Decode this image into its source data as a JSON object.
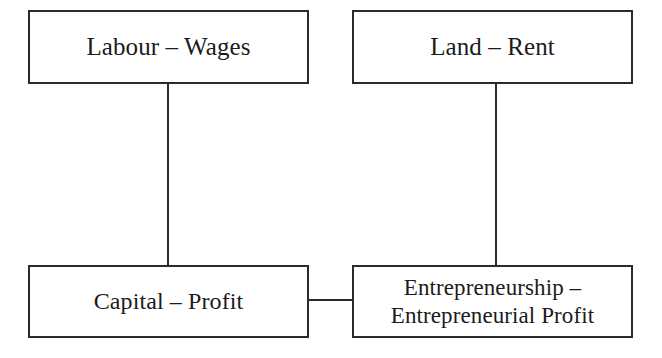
{
  "diagram": {
    "background_color": "#ffffff",
    "line_color": "#2b2b2b",
    "text_color": "#1c1c1c",
    "nodes": [
      {
        "id": "labour-wages",
        "label": "Labour – Wages",
        "factor": "Labour",
        "income": "Wages",
        "position": "top-left"
      },
      {
        "id": "land-rent",
        "label": "Land – Rent",
        "factor": "Land",
        "income": "Rent",
        "position": "top-right"
      },
      {
        "id": "capital-profit",
        "label": "Capital – Profit",
        "factor": "Capital",
        "income": "Profit",
        "position": "bottom-left"
      },
      {
        "id": "entrepreneurship",
        "label": "Entrepreneurship –\nEntrepreneurial Profit",
        "factor": "Entrepreneurship",
        "income": "Entrepreneurial Profit",
        "position": "bottom-right"
      }
    ],
    "connectors": [
      {
        "id": "labour-capital",
        "from": "labour-wages",
        "to": "capital-profit",
        "orientation": "vertical"
      },
      {
        "id": "land-entrepreneurship",
        "from": "land-rent",
        "to": "entrepreneurship",
        "orientation": "vertical"
      },
      {
        "id": "capital-entrepreneurship",
        "from": "capital-profit",
        "to": "entrepreneurship",
        "orientation": "horizontal"
      }
    ]
  }
}
